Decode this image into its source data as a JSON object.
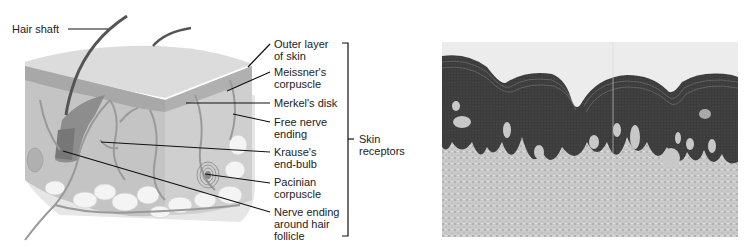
{
  "figure": {
    "left_panel": {
      "title": "Skin cross-section diagram",
      "hair_label": "Hair shaft",
      "labels": [
        {
          "id": "outer-layer",
          "lines": [
            "Outer layer",
            "of skin"
          ]
        },
        {
          "id": "meissner",
          "lines": [
            "Meissner's",
            "corpuscle"
          ]
        },
        {
          "id": "merkel",
          "lines": [
            "Merkel's disk"
          ]
        },
        {
          "id": "free-nerve",
          "lines": [
            "Free nerve",
            "ending"
          ]
        },
        {
          "id": "krause",
          "lines": [
            "Krause's",
            "end-bulb"
          ]
        },
        {
          "id": "pacinian",
          "lines": [
            "Pacinian",
            "corpuscle"
          ]
        },
        {
          "id": "hair-follicle",
          "lines": [
            "Nerve ending",
            "around hair",
            "follicle"
          ]
        }
      ],
      "bracket_label": [
        "Skin",
        "receptors"
      ]
    },
    "right_panel": {
      "title": "Skin micrograph"
    },
    "colors": {
      "background": "#ffffff",
      "text": "#222222",
      "leader_line": "#111111",
      "epidermis_top": "#d9d9d9",
      "dermis": "#bdbdbd",
      "fat": "#ebebeb",
      "micro_dark": "#3a3a3a",
      "micro_light": "#c8c8c8"
    }
  }
}
